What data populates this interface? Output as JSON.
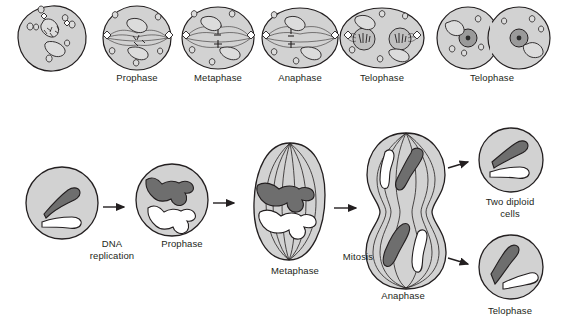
{
  "figure": {
    "colors": {
      "cytoplasm": "#d2d2d2",
      "cytoplasm_light": "#dcdcdc",
      "outline": "#231f20",
      "chromosome_dark": "#6e6e6e",
      "chromosome_light": "#ffffff",
      "nucleus": "#9a9a9a",
      "nucleolus": "#2b2b2b",
      "text": "#231f20",
      "background": "#ffffff"
    }
  },
  "top_row": {
    "cells": [
      {
        "id": "interphase-cell",
        "label": "",
        "x": 52,
        "y": 38
      },
      {
        "id": "prophase-cell",
        "label": "Prophase",
        "x": 137,
        "y": 38
      },
      {
        "id": "metaphase-cell",
        "label": "Metaphase",
        "x": 218,
        "y": 38
      },
      {
        "id": "anaphase-cell",
        "label": "Anaphase",
        "x": 300,
        "y": 38
      },
      {
        "id": "telophase-cell",
        "label": "Telophase",
        "x": 382,
        "y": 38
      },
      {
        "id": "telophase-two-cells",
        "label": "Telophase",
        "x": 492,
        "y": 38
      }
    ],
    "labels": [
      {
        "text": "Prophase",
        "x": 137,
        "y": 78
      },
      {
        "text": "Metaphase",
        "x": 218,
        "y": 78
      },
      {
        "text": "Anaphase",
        "x": 300,
        "y": 78
      },
      {
        "text": "Telophase",
        "x": 382,
        "y": 78
      },
      {
        "text": "Telophase",
        "x": 492,
        "y": 78
      }
    ]
  },
  "bottom_row": {
    "labels": [
      {
        "text": "DNA\nreplication",
        "x": 112,
        "y": 246
      },
      {
        "text": "Prophase",
        "x": 182,
        "y": 246
      },
      {
        "text": "Metaphase",
        "x": 295,
        "y": 272
      },
      {
        "text": "Mitosis",
        "x": 358,
        "y": 258
      },
      {
        "text": "Anaphase",
        "x": 403,
        "y": 292
      },
      {
        "text": "Two diploid\ncells",
        "x": 510,
        "y": 200
      },
      {
        "text": "Telophase",
        "x": 510,
        "y": 312
      }
    ]
  }
}
